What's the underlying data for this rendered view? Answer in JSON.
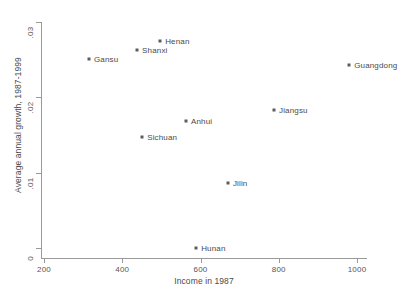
{
  "chart_data": {
    "type": "scatter",
    "title": "",
    "xlabel": "Income in 1987",
    "ylabel": "Average annual growth, 1987-1999",
    "xlim": [
      200,
      1000
    ],
    "ylim": [
      0,
      0.03
    ],
    "grid": false,
    "legend": "none",
    "xticks": [
      "200",
      "400",
      "600",
      "800",
      "1000"
    ],
    "xtick_values": [
      200,
      400,
      600,
      800,
      1000
    ],
    "yticks": [
      "0",
      ".01",
      ".02",
      ".03"
    ],
    "ytick_values": [
      0,
      0.01,
      0.02,
      0.03
    ],
    "points": [
      {
        "label": "Gansu",
        "x": 315,
        "y": 0.0251,
        "label_side": "right"
      },
      {
        "label": "Shanxi",
        "x": 438,
        "y": 0.0263,
        "label_side": "right"
      },
      {
        "label": "Henan",
        "x": 497,
        "y": 0.0275,
        "label_side": "right"
      },
      {
        "label": "Sichuan",
        "x": 451,
        "y": 0.0147,
        "label_side": "right"
      },
      {
        "label": "Anhui",
        "x": 563,
        "y": 0.0169,
        "label_side": "right"
      },
      {
        "label": "Hunan",
        "x": 589,
        "y": 0.0,
        "label_side": "right"
      },
      {
        "label": "Jilin",
        "x": 670,
        "y": 0.0086,
        "label_side": "right"
      },
      {
        "label": "Jiangsu",
        "x": 788,
        "y": 0.0183,
        "label_side": "right"
      },
      {
        "label": "Guangdong",
        "x": 980,
        "y": 0.0243,
        "label_side": "right"
      }
    ]
  },
  "colors": {
    "marker": "#5c5c5c",
    "axis": "#9a9a9a",
    "text": "#4a4a4a",
    "background": "#ffffff"
  }
}
